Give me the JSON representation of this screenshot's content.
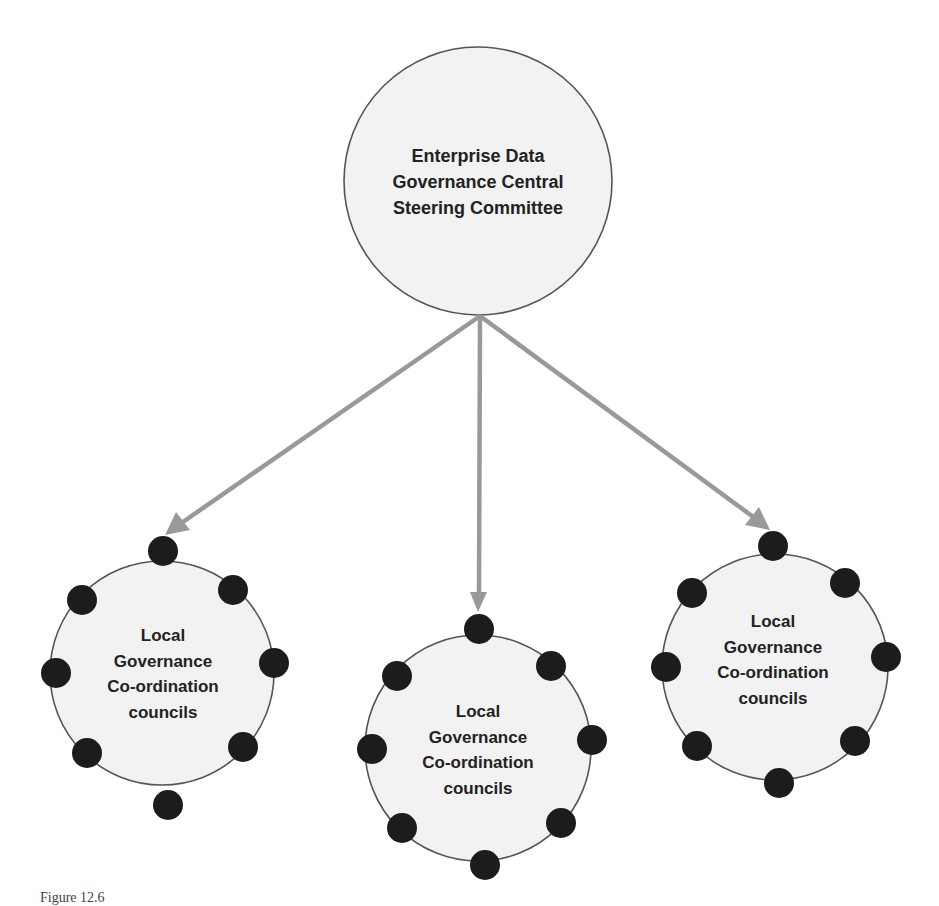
{
  "diagram": {
    "type": "hierarchy",
    "central_node": {
      "lines": [
        "Enterprise Data",
        "Governance Central",
        "Steering Committee"
      ],
      "cx": 478,
      "cy": 181,
      "r": 134
    },
    "arrow_origin": {
      "x": 480,
      "y": 316
    },
    "local_nodes": [
      {
        "lines": [
          "Local",
          "Governance",
          "Co-ordination",
          "councils"
        ],
        "cx": 162,
        "cy": 673,
        "r": 112,
        "arrow_tip": {
          "x": 165,
          "y": 535
        }
      },
      {
        "lines": [
          "Local",
          "Governance",
          "Co-ordination",
          "councils"
        ],
        "cx": 478,
        "cy": 748,
        "r": 113,
        "arrow_tip": {
          "x": 478,
          "y": 612
        }
      },
      {
        "lines": [
          "Local",
          "Governance",
          "Co-ordination",
          "councils"
        ],
        "cx": 775,
        "cy": 667,
        "r": 113,
        "arrow_tip": {
          "x": 770,
          "y": 530
        }
      }
    ],
    "member_dots_per_council": 8,
    "colors": {
      "node_fill": "#f2f2f2",
      "node_stroke": "#555555",
      "arrow": "#999999",
      "dot": "#1c1c1c",
      "text": "#222222"
    }
  },
  "caption": "Figure 12.6"
}
